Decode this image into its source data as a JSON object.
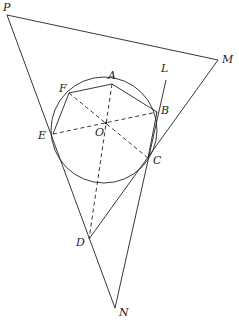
{
  "diagram": {
    "type": "geometry",
    "points": {
      "P": {
        "label": "P",
        "x": 7,
        "y": 15
      },
      "A": {
        "label": "A",
        "x": 112,
        "y": 84
      },
      "L": {
        "label": "L",
        "x": 166,
        "y": 80
      },
      "M": {
        "label": "M",
        "x": 218,
        "y": 60
      },
      "F": {
        "label": "F",
        "x": 69,
        "y": 93
      },
      "B": {
        "label": "B",
        "x": 157,
        "y": 112
      },
      "O": {
        "label": "O",
        "x": 106,
        "y": 123
      },
      "E": {
        "label": "E",
        "x": 53,
        "y": 134
      },
      "C": {
        "label": "C",
        "x": 148,
        "y": 158
      },
      "D": {
        "label": "D",
        "x": 89,
        "y": 239
      },
      "N": {
        "label": "N",
        "x": 115,
        "y": 308
      }
    },
    "circle": {
      "cx": 104,
      "cy": 130,
      "r": 53
    },
    "colors": {
      "stroke": "#222222",
      "background": "#ffffff"
    }
  }
}
